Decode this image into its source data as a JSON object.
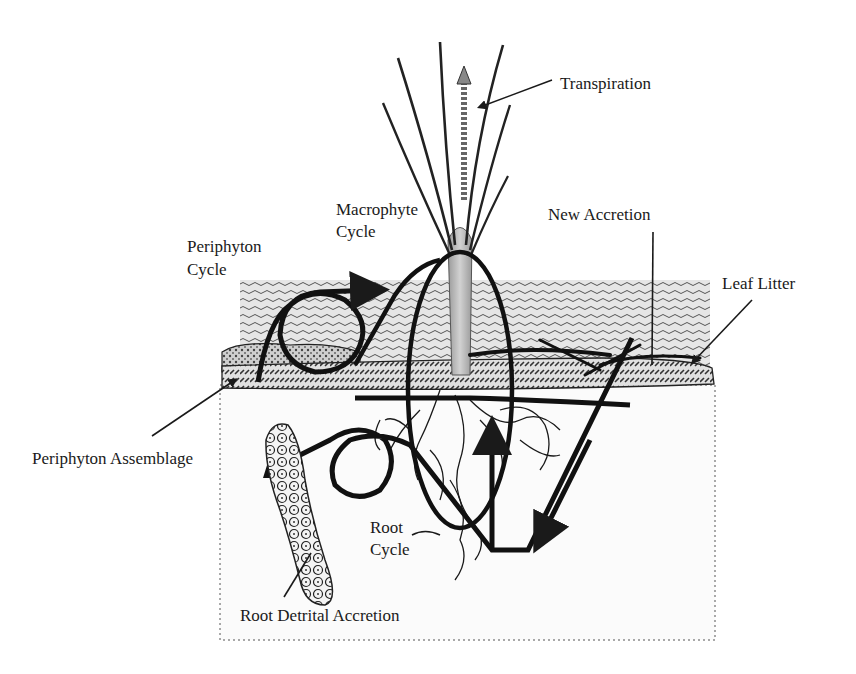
{
  "diagram": {
    "type": "wetland nutrient cycling schematic",
    "labels": {
      "transpiration": "Transpiration",
      "macrophyte_cycle_line1": "Macrophyte",
      "macrophyte_cycle_line2": "Cycle",
      "new_accretion": "New Accretion",
      "periphyton_cycle_line1": "Periphyton",
      "periphyton_cycle_line2": "Cycle",
      "leaf_litter": "Leaf Litter",
      "periphyton_assemblage": "Periphyton Assemblage",
      "root_cycle_line1": "Root",
      "root_cycle_line2": "Cycle",
      "root_detrital_accretion": "Root Detrital Accretion"
    },
    "colors": {
      "ink": "#1a1a1a",
      "water_fill": "#d9d9d9",
      "stem_fill": "#bdbdbd",
      "soil_fill": "#fbfbfb",
      "background": "#ffffff"
    }
  }
}
